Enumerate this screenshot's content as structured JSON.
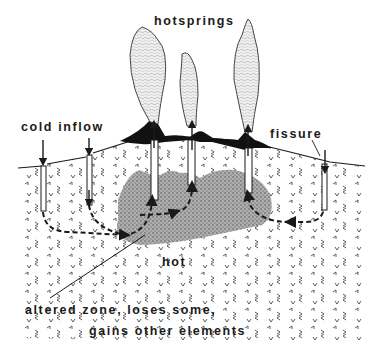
{
  "diagram": {
    "labels": {
      "hotsprings": "hotsprings",
      "cold_inflow": "cold inflow",
      "fissure": "fissure",
      "hot": "hot",
      "altered_zone_line1": "altered zone, loses some,",
      "altered_zone_line2": "gains other elements"
    },
    "colors": {
      "ink": "#1a1a1a",
      "steam": "#d8d8d8",
      "altered_zone": "#9a9a9a",
      "background": "#ffffff"
    },
    "elements": [
      {
        "id": "steam-plume-left",
        "type": "hotspring plume"
      },
      {
        "id": "steam-plume-middle",
        "type": "hotspring plume"
      },
      {
        "id": "steam-plume-right",
        "type": "hotspring plume"
      },
      {
        "id": "cold-inflow-left",
        "type": "downward arrow"
      },
      {
        "id": "cold-inflow-right",
        "type": "downward arrow"
      },
      {
        "id": "fissure",
        "type": "downward arrow"
      },
      {
        "id": "altered-zone",
        "type": "stippled region"
      },
      {
        "id": "flow-path",
        "type": "dashed circulation arrows"
      }
    ]
  }
}
